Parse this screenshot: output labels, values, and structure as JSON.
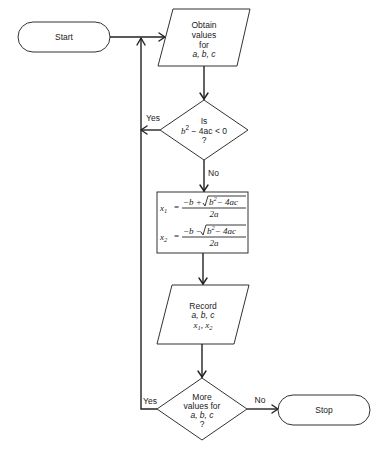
{
  "diagram": {
    "type": "flowchart",
    "nodes": [
      {
        "id": "start",
        "shape": "terminator",
        "label": "Start"
      },
      {
        "id": "input",
        "shape": "parallelogram",
        "lines": [
          "Obtain",
          "values",
          "for",
          "a, b, c"
        ]
      },
      {
        "id": "check",
        "shape": "diamond",
        "lines": [
          "Is",
          "b² − 4ac < 0",
          "?"
        ]
      },
      {
        "id": "compute",
        "shape": "rectangle",
        "formulas": [
          "x₁ = (−b + √(b² − 4ac)) / 2a",
          "x₂ = (−b − √(b² − 4ac)) / 2a"
        ]
      },
      {
        "id": "record",
        "shape": "parallelogram",
        "lines": [
          "Record",
          "a, b, c",
          "x₁ , x₂"
        ]
      },
      {
        "id": "more",
        "shape": "diamond",
        "lines": [
          "More",
          "values for",
          "a, b, c",
          "?"
        ]
      },
      {
        "id": "stop",
        "shape": "terminator",
        "label": "Stop"
      }
    ],
    "edges": [
      {
        "from": "start",
        "to": "input",
        "label": ""
      },
      {
        "from": "input",
        "to": "check",
        "label": ""
      },
      {
        "from": "check",
        "to": "input",
        "label": "Yes"
      },
      {
        "from": "check",
        "to": "compute",
        "label": "No"
      },
      {
        "from": "compute",
        "to": "record",
        "label": ""
      },
      {
        "from": "record",
        "to": "more",
        "label": ""
      },
      {
        "from": "more",
        "to": "input",
        "label": "Yes"
      },
      {
        "from": "more",
        "to": "stop",
        "label": "No"
      }
    ]
  },
  "labels": {
    "start": "Start",
    "stop": "Stop",
    "input": {
      "l1": "Obtain",
      "l2": "values",
      "l3": "for",
      "l4": "a, b, c"
    },
    "check": {
      "l1": "Is",
      "b": "b",
      "exp": "2",
      "rest": " − 4ac < 0",
      "q": "?"
    },
    "compute": {
      "x": "x",
      "sub1": "1",
      "sub2": "2",
      "eq": "=",
      "num1": "−b +",
      "num2": "−b −",
      "rad_b": "b",
      "rad_exp": "2",
      "rad_rest": "− 4ac",
      "den": "2a"
    },
    "record": {
      "l1": "Record",
      "l2": "a, b, c",
      "x": "x",
      "sub1": "1",
      "comma": ",",
      "sub2": "2"
    },
    "more": {
      "l1": "More",
      "l2": "values for",
      "l3": "a, b, c",
      "q": "?"
    },
    "edge_yes_1": "Yes",
    "edge_no_1": "No",
    "edge_yes_2": "Yes",
    "edge_no_2": "No"
  }
}
